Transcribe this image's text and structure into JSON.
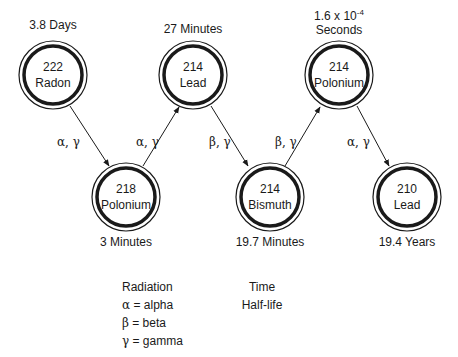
{
  "diagram": {
    "type": "radioactive-decay-chain",
    "nodes": [
      {
        "id": "n1",
        "mass": "222",
        "element": "Radon",
        "half_life": "3.8 Days",
        "cx": 53,
        "cy": 75
      },
      {
        "id": "n2",
        "mass": "218",
        "element": "Polonium",
        "half_life": "3 Minutes",
        "cx": 126,
        "cy": 197
      },
      {
        "id": "n3",
        "mass": "214",
        "element": "Lead",
        "half_life": "27 Minutes",
        "cx": 193,
        "cy": 75
      },
      {
        "id": "n4",
        "mass": "214",
        "element": "Bismuth",
        "half_life": "19.7 Minutes",
        "cx": 270,
        "cy": 197
      },
      {
        "id": "n5",
        "mass": "214",
        "element": "Polonium",
        "half_life_base": "1.6 x 10",
        "half_life_exp": "-4",
        "half_life_unit": "Seconds",
        "cx": 339,
        "cy": 75
      },
      {
        "id": "n6",
        "mass": "210",
        "element": "Lead",
        "half_life": "19.4 Years",
        "cx": 407,
        "cy": 197
      }
    ],
    "edges": [
      {
        "from": "n1",
        "to": "n2",
        "radiation": "α, γ"
      },
      {
        "from": "n2",
        "to": "n3",
        "radiation": "α, γ"
      },
      {
        "from": "n3",
        "to": "n4",
        "radiation": "β, γ"
      },
      {
        "from": "n4",
        "to": "n5",
        "radiation": "β, γ"
      },
      {
        "from": "n5",
        "to": "n6",
        "radiation": "α, γ"
      }
    ]
  },
  "legend": {
    "radiation_title": "Radiation",
    "items": [
      {
        "symbol": "α",
        "text": " = alpha"
      },
      {
        "symbol": "β",
        "text": " = beta"
      },
      {
        "symbol": "γ",
        "text": " = gamma"
      }
    ],
    "time_title": "Time",
    "time_subtitle": "Half-life"
  }
}
